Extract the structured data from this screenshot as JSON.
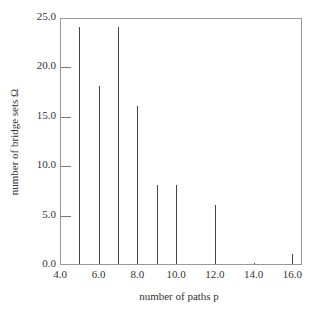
{
  "chart_data": {
    "type": "bar",
    "title": "",
    "xlabel": "number of paths p",
    "ylabel": "number of bridge sets Ω",
    "x": [
      5,
      6,
      7,
      8,
      9,
      10,
      12,
      14,
      16
    ],
    "values": [
      24,
      18,
      24,
      16,
      8,
      8,
      6,
      0.1,
      1
    ],
    "xlim": [
      4.0,
      16.5
    ],
    "ylim": [
      0.0,
      25.0
    ],
    "xticks": [
      "4.0",
      "6.0",
      "8.0",
      "10.0",
      "12.0",
      "14.0",
      "16.0"
    ],
    "yticks": [
      "0.0",
      "5.0",
      "10.0",
      "15.0",
      "20.0",
      "25.0"
    ],
    "grid": false,
    "legend": null
  }
}
